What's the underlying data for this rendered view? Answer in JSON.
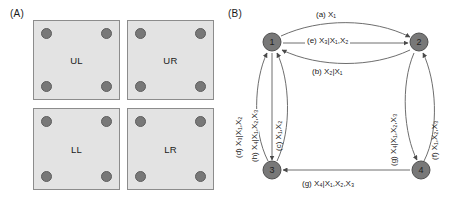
{
  "figure": {
    "panel_a_label": "(A)",
    "panel_b_label": "(B)"
  },
  "panel_a": {
    "quadrants": [
      {
        "id": "ul",
        "label": "UL"
      },
      {
        "id": "ur",
        "label": "UR"
      },
      {
        "id": "ll",
        "label": "LL"
      },
      {
        "id": "lr",
        "label": "LR"
      }
    ],
    "dots_per_quadrant": 4,
    "colors": {
      "square_fill": "#e3e3e3",
      "square_border": "#8c8c8c",
      "dot_fill": "#787878"
    }
  },
  "panel_b": {
    "nodes": [
      {
        "id": "1",
        "label": "1"
      },
      {
        "id": "2",
        "label": "2"
      },
      {
        "id": "3",
        "label": "3"
      },
      {
        "id": "4",
        "label": "4"
      }
    ],
    "edges": [
      {
        "key": "a",
        "tag": "(a)",
        "from": "1",
        "to": "2",
        "expr_main": "X",
        "expr_sub": "1",
        "label": "(a) X₁"
      },
      {
        "key": "b",
        "tag": "(b)",
        "from": "2",
        "to": "1",
        "expr_main": "X",
        "expr_sub": "2",
        "label": "(b) X₂|X₁"
      },
      {
        "key": "c",
        "tag": "(c)",
        "from": "3",
        "to": "1",
        "label": "(c) X₁,X₂"
      },
      {
        "key": "d",
        "tag": "(d)",
        "from": "3",
        "to": "1",
        "label": "(d) X₃|X₁,X₂"
      },
      {
        "key": "e",
        "tag": "(e)",
        "from": "1",
        "to": "2",
        "label": "(e) X₃|X₁,X₂"
      },
      {
        "key": "f",
        "tag": "(f)",
        "from": "4",
        "to": "2",
        "label": "(f) X₁,X₂,X₃"
      },
      {
        "key": "g_right",
        "tag": "(g)",
        "from": "2",
        "to": "4",
        "label": "(g) X₄|X₁,X₂,X₃"
      },
      {
        "key": "g_bottom",
        "tag": "(g)",
        "from": "4",
        "to": "3",
        "label": "(g) X₄|X₁,X₂,X₃"
      },
      {
        "key": "h",
        "tag": "(h)",
        "from": "1",
        "to": "3",
        "label": "(h) X₄|X₁,X₂,X₃"
      }
    ],
    "colors": {
      "node_fill": "#787878",
      "edge_stroke": "#6e6e6e"
    }
  }
}
